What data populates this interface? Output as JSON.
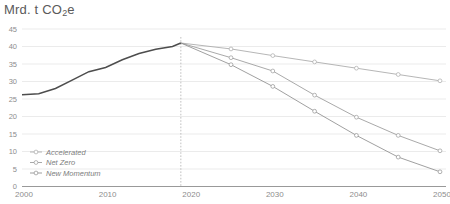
{
  "chart_data": {
    "type": "line",
    "title": "Mrd. t CO2e",
    "title_main": "Mrd. t CO",
    "title_sub": "2",
    "title_tail": "e",
    "xlabel": "",
    "ylabel": "",
    "xlim": [
      2000,
      2050
    ],
    "ylim": [
      0,
      45
    ],
    "yticks": [
      0,
      5,
      10,
      15,
      20,
      25,
      30,
      35,
      40,
      45
    ],
    "ytick_labels": [
      "0",
      "5",
      "10",
      "15",
      "20",
      "25",
      "30",
      "35",
      "40",
      "45"
    ],
    "xticks": [
      2000,
      2010,
      2020,
      2030,
      2040,
      2050
    ],
    "xtick_labels": [
      "2000",
      "2010",
      "2020",
      "2030",
      "2040",
      "2050"
    ],
    "grid": true,
    "grid_axis": "y",
    "legend_position": "bottom-left",
    "marker_style": "open-circle",
    "annotations": [
      {
        "name": "split-year-line",
        "type": "vline",
        "x": 2019,
        "style": "dotted"
      }
    ],
    "historical": {
      "name": "Historical",
      "color": "#4d4d4d",
      "x": [
        2000,
        2002,
        2004,
        2006,
        2008,
        2010,
        2012,
        2014,
        2016,
        2018,
        2019
      ],
      "values": [
        26.2,
        26.5,
        28.0,
        30.4,
        32.8,
        34.0,
        36.2,
        38.0,
        39.2,
        40.0,
        41.0
      ]
    },
    "series": [
      {
        "name": "Accelerated",
        "color": "#a9a9a9",
        "x": [
          2019,
          2025,
          2030,
          2035,
          2040,
          2045,
          2050
        ],
        "values": [
          41.0,
          39.3,
          37.4,
          35.6,
          33.8,
          32.0,
          30.2
        ]
      },
      {
        "name": "Net Zero",
        "color": "#9a9a9a",
        "x": [
          2019,
          2025,
          2030,
          2035,
          2040,
          2045,
          2050
        ],
        "values": [
          41.0,
          36.8,
          33.0,
          26.1,
          19.8,
          14.6,
          10.2
        ]
      },
      {
        "name": "New Momentum",
        "color": "#8f8f8f",
        "x": [
          2019,
          2025,
          2030,
          2035,
          2040,
          2045,
          2050
        ],
        "values": [
          41.0,
          34.8,
          28.6,
          21.5,
          14.6,
          8.4,
          4.2
        ]
      }
    ],
    "legend": [
      {
        "label": "Accelerated",
        "color": "#a9a9a9"
      },
      {
        "label": "Net Zero",
        "color": "#9a9a9a"
      },
      {
        "label": "New Momentum",
        "color": "#8f8f8f"
      }
    ]
  }
}
